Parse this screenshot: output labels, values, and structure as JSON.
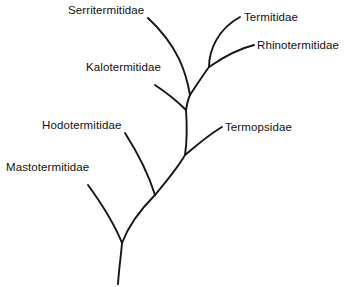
{
  "figure": {
    "type": "phylogenetic-tree",
    "orientation": "root-at-bottom",
    "background_color": "#ffffff",
    "line_color": "#151515",
    "text_color": "#111111",
    "width": 356,
    "height": 287
  },
  "taxa": [
    {
      "id": "serritermitidae",
      "label": "Serritermitidae",
      "label_x": 68,
      "label_y": 4,
      "tip_x": 148,
      "tip_y": 18
    },
    {
      "id": "termitidae",
      "label": "Termitidae",
      "label_x": 244,
      "label_y": 11,
      "tip_x": 240,
      "tip_y": 17
    },
    {
      "id": "rhinotermitidae",
      "label": "Rhinotermitidae",
      "label_x": 257,
      "label_y": 39,
      "tip_x": 254,
      "tip_y": 45
    },
    {
      "id": "kalotermitidae",
      "label": "Kalotermitidae",
      "label_x": 86,
      "label_y": 61,
      "tip_x": 155,
      "tip_y": 85
    },
    {
      "id": "termopsidae",
      "label": "Termopsidae",
      "label_x": 225,
      "label_y": 121,
      "tip_x": 222,
      "tip_y": 127
    },
    {
      "id": "hodotermitidae",
      "label": "Hodotermitidae",
      "label_x": 42,
      "label_y": 119,
      "tip_x": 125,
      "tip_y": 133
    },
    {
      "id": "mastotermitidae",
      "label": "Mastotermitidae",
      "label_x": 6,
      "label_y": 161,
      "tip_x": 88,
      "tip_y": 185
    }
  ],
  "nodes": {
    "root_base": {
      "x": 118,
      "y": 284
    },
    "mastotermitidae_split": {
      "x": 122,
      "y": 243
    },
    "hodotermitidae_split": {
      "x": 155,
      "y": 195
    },
    "termopsidae_split": {
      "x": 185,
      "y": 155
    },
    "kalotermitidae_split": {
      "x": 186,
      "y": 110
    },
    "serritermitidae_split": {
      "x": 190,
      "y": 95
    },
    "termitidae_rhino_split": {
      "x": 209,
      "y": 67
    }
  },
  "branches": [
    {
      "id": "root-stem",
      "name": "root-stem",
      "path": "M 118 284 C 119 268 121 256 122 243"
    },
    {
      "id": "mastotermitidae-branch",
      "name": "mastotermitidae-branch",
      "path": "M 122 243 C 116 228 104 207 88 185"
    },
    {
      "id": "trunk-root-to-hodotermitidae",
      "name": "trunk-root-to-hodotermitidae",
      "path": "M 122 243 C 128 227 141 209 155 195"
    },
    {
      "id": "hodotermitidae-branch",
      "name": "hodotermitidae-branch",
      "path": "M 155 195 C 150 179 139 155 125 133"
    },
    {
      "id": "trunk-hodotermitidae-to-termopsidae",
      "name": "trunk-hodotermitidae-to-termopsidae",
      "path": "M 155 195 C 164 184 177 169 185 155"
    },
    {
      "id": "termopsidae-branch",
      "name": "termopsidae-branch",
      "path": "M 185 155 C 195 147 208 135 222 127"
    },
    {
      "id": "trunk-termopsidae-to-kalotermitidae",
      "name": "trunk-termopsidae-to-kalotermitidae",
      "path": "M 185 155 C 187 141 187 124 186 110"
    },
    {
      "id": "kalotermitidae-branch",
      "name": "kalotermitidae-branch",
      "path": "M 186 110 C 178 102 167 93 155 85"
    },
    {
      "id": "trunk-kalotermitidae-to-serritermitidae",
      "name": "trunk-kalotermitidae-to-serritermitidae",
      "path": "M 186 110 C 187 104 188 99 190 95"
    },
    {
      "id": "serritermitidae-branch",
      "name": "serritermitidae-branch",
      "path": "M 190 95 C 186 72 178 46 148 18"
    },
    {
      "id": "trunk-serritermitidae-to-termitidae-node",
      "name": "trunk-serritermitidae-to-termitidae-node",
      "path": "M 190 95 C 196 86 203 75 209 67"
    },
    {
      "id": "termitidae-branch",
      "name": "termitidae-branch",
      "path": "M 209 67 C 209 50 218 29 240 17"
    },
    {
      "id": "rhinotermitidae-branch",
      "name": "rhinotermitidae-branch",
      "path": "M 209 67 C 219 60 234 50 254 45"
    }
  ]
}
